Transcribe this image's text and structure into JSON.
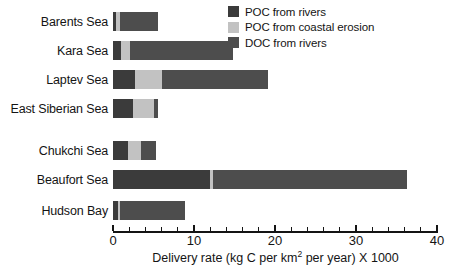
{
  "chart_data": {
    "type": "bar",
    "orientation": "horizontal",
    "stacked": true,
    "title": "",
    "xlabel": "Delivery rate (kg C per km2 per year) X 1000",
    "xlabel_parts": {
      "pre": "Delivery rate (kg C per km",
      "sup": "2",
      "post": " per year) X 1000"
    },
    "ylabel": "",
    "xlim": [
      0,
      40
    ],
    "xticks": [
      0,
      10,
      20,
      30,
      40
    ],
    "xtick_labels": [
      "0",
      "10",
      "20",
      "30",
      "40"
    ],
    "minor_tick_step": 2,
    "grid": false,
    "legend_position": "top-right",
    "categories": [
      "Barents Sea",
      "Kara Sea",
      "Laptev Sea",
      "East Siberian Sea",
      "Chukchi Sea",
      "Beaufort Sea",
      "Hudson Bay"
    ],
    "series": [
      {
        "name": "POC from rivers",
        "color": "#3b3b3b",
        "values": [
          0.35,
          1.0,
          2.7,
          2.5,
          1.9,
          12.0,
          0.6
        ]
      },
      {
        "name": "POC from coastal erosion",
        "color": "#c2c2c2",
        "values": [
          0.5,
          1.1,
          3.3,
          2.5,
          1.5,
          0.4,
          0.3
        ]
      },
      {
        "name": "DOC from rivers",
        "color": "#4d4d4d",
        "values": [
          4.7,
          12.7,
          13.1,
          0.5,
          1.9,
          23.9,
          8.0
        ]
      }
    ],
    "totals": [
      5.55,
      14.8,
      19.1,
      5.5,
      5.3,
      36.3,
      8.9
    ]
  },
  "legend": {
    "items": [
      {
        "label": "POC from rivers",
        "color": "#3b3b3b"
      },
      {
        "label": "POC from coastal erosion",
        "color": "#c2c2c2"
      },
      {
        "label": "DOC from rivers",
        "color": "#4d4d4d"
      }
    ]
  }
}
